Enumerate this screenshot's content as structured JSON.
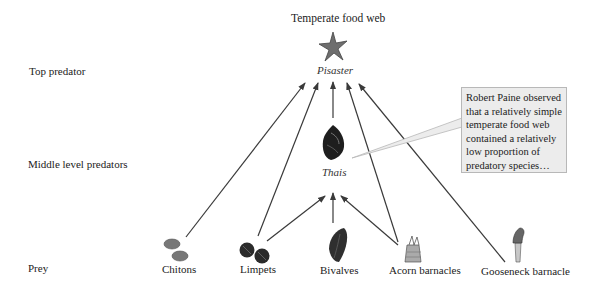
{
  "title": "Temperate food web",
  "levels": {
    "top": "Top predator",
    "middle": "Middle level predators",
    "prey": "Prey"
  },
  "top_predator": {
    "name": "Pisaster",
    "icon": "starfish-icon"
  },
  "middle_predator": {
    "name": "Thais",
    "icon": "snail-shell-icon"
  },
  "prey": [
    {
      "name": "Chitons",
      "icon": "chiton-icon"
    },
    {
      "name": "Limpets",
      "icon": "limpet-icon"
    },
    {
      "name": "Bivalves",
      "icon": "mussel-icon"
    },
    {
      "name": "Acorn barnacles",
      "icon": "acorn-barnacle-icon"
    },
    {
      "name": "Gooseneck barnacle",
      "icon": "gooseneck-barnacle-icon"
    }
  ],
  "callout": {
    "text": "Robert Paine observed that a relatively simple temperate food web contained a relatively low proportion of predatory species…"
  },
  "edges": [
    {
      "from": "Chitons",
      "to": "Pisaster"
    },
    {
      "from": "Limpets",
      "to": "Pisaster"
    },
    {
      "from": "Limpets",
      "to": "Thais"
    },
    {
      "from": "Bivalves",
      "to": "Thais"
    },
    {
      "from": "Thais",
      "to": "Pisaster"
    },
    {
      "from": "Acorn barnacles",
      "to": "Thais"
    },
    {
      "from": "Acorn barnacles",
      "to": "Pisaster"
    },
    {
      "from": "Gooseneck barnacle",
      "to": "Pisaster"
    }
  ],
  "colors": {
    "arrow": "#3a3a3a",
    "callout_bg": "#ececec",
    "callout_border": "#b8b8b8"
  }
}
